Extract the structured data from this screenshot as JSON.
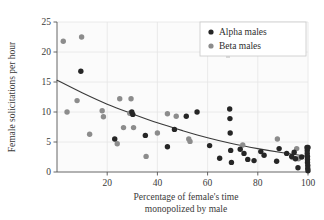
{
  "chart_data": {
    "type": "scatter",
    "title": "",
    "xlabel": "Percentage of female's time monopolized by male",
    "xlabel_line1": "Percentage of female's time",
    "xlabel_line2": "monopolized by male",
    "ylabel": "Female solicitations per hour",
    "xlim": [
      0,
      100
    ],
    "ylim": [
      0,
      25
    ],
    "xticks": [
      20,
      40,
      60,
      80,
      100
    ],
    "yticks": [
      0,
      5,
      10,
      15,
      20,
      25
    ],
    "xtick_labels": [
      "20",
      "40",
      "60",
      "80",
      "100"
    ],
    "ytick_labels": [
      "0",
      "5",
      "10",
      "15",
      "20",
      "25"
    ],
    "grid": true,
    "grid_color": "#e8e8e8",
    "legend_position": "top-right",
    "series": [
      {
        "name": "Alpha males",
        "color": "#262626",
        "marker": "circle",
        "points": [
          [
            9.5,
            16.8
          ],
          [
            23.0,
            5.5
          ],
          [
            29.8,
            10.0
          ],
          [
            30.2,
            9.6
          ],
          [
            35.2,
            6.1
          ],
          [
            44.0,
            4.2
          ],
          [
            46.8,
            7.1
          ],
          [
            51.5,
            9.3
          ],
          [
            55.8,
            10.0
          ],
          [
            60.8,
            4.4
          ],
          [
            64.8,
            2.3
          ],
          [
            68.8,
            10.5
          ],
          [
            68.9,
            8.9
          ],
          [
            69.0,
            6.5
          ],
          [
            69.2,
            3.6
          ],
          [
            69.5,
            1.6
          ],
          [
            73.0,
            3.8
          ],
          [
            74.5,
            3.1
          ],
          [
            76.0,
            2.1
          ],
          [
            78.5,
            1.9
          ],
          [
            81.2,
            3.4
          ],
          [
            82.5,
            2.8
          ],
          [
            87.5,
            1.8
          ],
          [
            88.5,
            3.9
          ],
          [
            91.5,
            3.1
          ],
          [
            93.5,
            2.6
          ],
          [
            94.5,
            3.3
          ],
          [
            95.0,
            2.2
          ],
          [
            96.0,
            0.7
          ],
          [
            97.5,
            2.5
          ],
          [
            99.6,
            4.1
          ],
          [
            99.7,
            3.6
          ],
          [
            99.7,
            3.1
          ],
          [
            99.8,
            2.6
          ],
          [
            99.8,
            2.1
          ],
          [
            99.8,
            1.6
          ],
          [
            99.9,
            1.1
          ],
          [
            99.9,
            0.6
          ],
          [
            100.0,
            0.2
          ],
          [
            100.0,
            4.1
          ]
        ]
      },
      {
        "name": "Beta males",
        "color": "#8c8c8c",
        "marker": "circle",
        "points": [
          [
            2.5,
            21.8
          ],
          [
            9.8,
            22.5
          ],
          [
            4.0,
            10.0
          ],
          [
            8.0,
            11.9
          ],
          [
            13.0,
            6.3
          ],
          [
            18.0,
            10.2
          ],
          [
            18.5,
            9.2
          ],
          [
            24.0,
            4.7
          ],
          [
            25.0,
            12.2
          ],
          [
            26.5,
            7.4
          ],
          [
            29.5,
            12.2
          ],
          [
            29.0,
            9.8
          ],
          [
            30.5,
            7.4
          ],
          [
            35.5,
            2.6
          ],
          [
            40.0,
            6.5
          ],
          [
            44.0,
            9.7
          ],
          [
            47.5,
            9.3
          ],
          [
            52.5,
            5.5
          ],
          [
            53.0,
            5.1
          ],
          [
            74.0,
            4.5
          ],
          [
            87.8,
            5.5
          ],
          [
            93.8,
            2.4
          ],
          [
            95.5,
            3.9
          ],
          [
            96.2,
            2.2
          ]
        ]
      }
    ],
    "trend_curve": {
      "description": "decaying fitted curve",
      "color": "#3a3a3a",
      "points": [
        [
          0,
          15.3
        ],
        [
          10,
          13.2
        ],
        [
          20,
          11.3
        ],
        [
          30,
          9.7
        ],
        [
          40,
          8.2
        ],
        [
          50,
          6.9
        ],
        [
          60,
          5.7
        ],
        [
          70,
          4.7
        ],
        [
          80,
          3.9
        ],
        [
          90,
          3.2
        ],
        [
          100,
          2.6
        ]
      ]
    }
  },
  "legend": {
    "items": [
      {
        "label": "Alpha males",
        "color": "#262626"
      },
      {
        "label": "Beta males",
        "color": "#8c8c8c"
      }
    ]
  }
}
